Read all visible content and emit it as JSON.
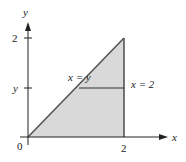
{
  "diagram": {
    "type": "region-of-integration",
    "axes": {
      "x_label": "x",
      "y_label": "y",
      "origin_label": "0"
    },
    "ticks": {
      "x": [
        {
          "value": 2,
          "label": "2"
        }
      ],
      "y": [
        {
          "value": 2,
          "label": "2"
        },
        {
          "value": "y",
          "label": "y"
        }
      ]
    },
    "curves": [
      {
        "id": "line-x-eq-y",
        "label": "x = y"
      },
      {
        "id": "line-x-eq-2",
        "label": "x = 2"
      }
    ],
    "region": {
      "description": "triangle bounded by y = 0, x = y, x = 2",
      "vertices": [
        [
          0,
          0
        ],
        [
          2,
          2
        ],
        [
          2,
          0
        ]
      ],
      "fill_color": "#d9d9d9"
    },
    "horizontal_strip": {
      "y": "y",
      "from_x": "y",
      "to_x": 2
    },
    "colors": {
      "axis": "#222222",
      "boundary": "#555555",
      "fill": "#d9d9d9"
    }
  }
}
